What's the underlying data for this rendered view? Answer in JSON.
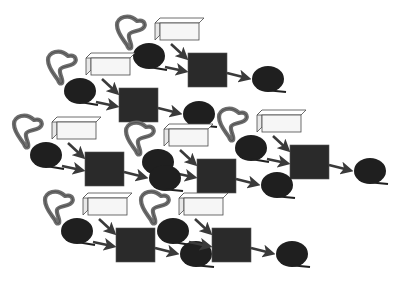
{
  "diagram": {
    "colors": {
      "background": "#ffffff",
      "enzyme_fill": "#6e6e6e",
      "enzyme_stroke": "#3a3a3a",
      "box_face": "#f6f6f6",
      "box_top": "#ffffff",
      "box_stroke": "#4a4a4a",
      "substrate": "#1f1f1f",
      "complex": "#2a2a2a",
      "arrow": "#3a3a3a"
    },
    "motif_elements": [
      "enzyme",
      "cofactor-box",
      "substrate",
      "complex",
      "product"
    ],
    "motif_count": 7
  }
}
